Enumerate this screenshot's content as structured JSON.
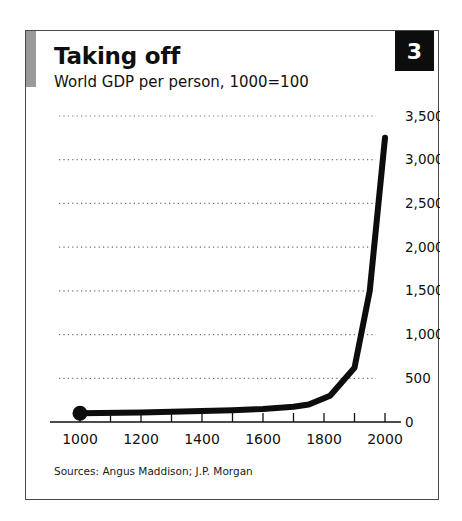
{
  "card": {
    "badge_number": "3",
    "accent_color": "#9a9a9a",
    "badge_bg": "#0d0d0d",
    "border_color": "#4a4a4a"
  },
  "header": {
    "title": "Taking off",
    "subtitle": "World GDP per person, 1000=100"
  },
  "footer": {
    "source": "Sources: Angus Maddison; J.P. Morgan"
  },
  "chart_data": {
    "type": "line",
    "title": "Taking off",
    "subtitle": "World GDP per person, 1000=100",
    "xlabel": "",
    "ylabel": "",
    "xlim": [
      1000,
      2000
    ],
    "ylim": [
      0,
      3500
    ],
    "grid": true,
    "legend": false,
    "y_axis_position": "right",
    "x_ticks_major": [
      1000,
      1200,
      1400,
      1600,
      1800,
      2000
    ],
    "x_ticks_minor": [
      1100,
      1300,
      1500,
      1700,
      1900
    ],
    "x_ticklabels": [
      "1000",
      "1200",
      "1400",
      "1600",
      "1800",
      "2000"
    ],
    "y_ticks": [
      0,
      500,
      1000,
      1500,
      2000,
      2500,
      3000,
      3500
    ],
    "y_ticklabels": [
      "0",
      "500",
      "1,000",
      "1,500",
      "2,000",
      "2,500",
      "3,000",
      "3,500"
    ],
    "line_color": "#0d0d0d",
    "marker_at_start": true,
    "series": [
      {
        "name": "World GDP per person (1000 = 100)",
        "x": [
          1000,
          1200,
          1400,
          1500,
          1600,
          1700,
          1750,
          1820,
          1900,
          1950,
          2000
        ],
        "values": [
          100,
          110,
          125,
          135,
          150,
          175,
          200,
          300,
          620,
          1500,
          3250
        ]
      }
    ]
  }
}
